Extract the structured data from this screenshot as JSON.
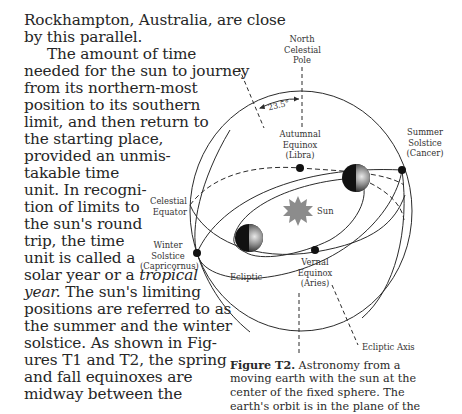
{
  "body_text": {
    "lines": [
      {
        "text": "Rockhampton, Australia, are close",
        "top": 12,
        "indent": 0
      },
      {
        "text": "by this parallel.",
        "top": 29,
        "indent": 0
      },
      {
        "text": "The amount of time",
        "top": 46,
        "indent": 24
      },
      {
        "text": "needed for the sun to journey",
        "top": 63,
        "indent": 0
      },
      {
        "text": "from its northern-most",
        "top": 80,
        "indent": 0
      },
      {
        "text": "position to its southern",
        "top": 97,
        "indent": 0
      },
      {
        "text": "limit, and then return to",
        "top": 114,
        "indent": 0
      },
      {
        "text": "the starting place,",
        "top": 131,
        "indent": 0
      },
      {
        "text": "provided an unmis-",
        "top": 148,
        "indent": 0
      },
      {
        "text": "takable time",
        "top": 165,
        "indent": 0
      },
      {
        "text": "unit. In recogni-",
        "top": 182,
        "indent": 0
      },
      {
        "text": "tion of limits to",
        "top": 199,
        "indent": 0
      },
      {
        "text": "the sun's round",
        "top": 216,
        "indent": 0
      },
      {
        "text": "trip, the time",
        "top": 233,
        "indent": 0
      },
      {
        "text": "unit is called a",
        "top": 250,
        "indent": 0
      },
      {
        "text_before": "solar year or a ",
        "italic": "tropical",
        "text_after": "",
        "top": 267,
        "indent": 0
      },
      {
        "text_before": "",
        "italic": "year.",
        "text_after": " The sun's limiting",
        "top": 284,
        "indent": 0
      },
      {
        "text": "positions are referred to as",
        "top": 301,
        "indent": 0
      },
      {
        "text": "the summer and the winter",
        "top": 318,
        "indent": 0
      },
      {
        "text": "solstice. As shown in Fig-",
        "top": 335,
        "indent": 0
      },
      {
        "text": "ures T1 and T2, the spring",
        "top": 352,
        "indent": 0
      },
      {
        "text": "and fall equinoxes are",
        "top": 369,
        "indent": 0
      },
      {
        "text": "midway between the",
        "top": 386,
        "indent": 0
      }
    ]
  },
  "diagram": {
    "labels": {
      "north_pole": [
        "North",
        "Celestial",
        "Pole"
      ],
      "angle": "23.5°",
      "autumnal": [
        "Autumnal",
        "Equinox",
        "(Libra)"
      ],
      "summer": [
        "Summer",
        "Solstice",
        "(Cancer)"
      ],
      "celestial_equator": [
        "Celestial",
        "Equator"
      ],
      "sun": "Sun",
      "winter": [
        "Winter",
        "Solstice",
        "(Capricornus)"
      ],
      "ecliptic": "Ecliptic",
      "vernal": [
        "Vernal",
        "Equinox",
        "(Aries)"
      ],
      "ecliptic_axis": "Ecliptic Axis"
    },
    "colors": {
      "line": "#2b2b2b",
      "sun": "#8c8c8c",
      "planet_dark": "#111111"
    }
  },
  "caption": {
    "label": "Figure T2.",
    "lines": [
      " Astronomy from a",
      "moving earth with the sun at the",
      "center of the fixed sphere. The",
      "earth's orbit is in the plane of the"
    ]
  }
}
